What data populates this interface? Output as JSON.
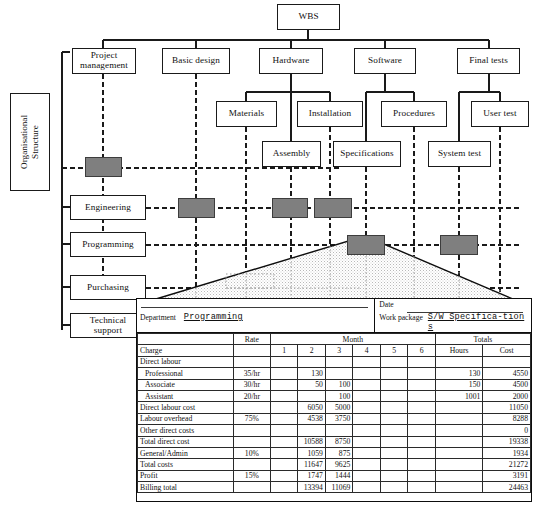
{
  "diagram": {
    "org_panel_label": "Organisational\nStructure",
    "wbs": {
      "root": {
        "label": "WBS"
      },
      "level1": [
        {
          "label": "Project\nmanagement"
        },
        {
          "label": "Basic design"
        },
        {
          "label": "Hardware"
        },
        {
          "label": "Software"
        },
        {
          "label": "Final tests"
        }
      ],
      "level2": [
        {
          "label": "Materials"
        },
        {
          "label": "Installation"
        },
        {
          "label": "Procedures"
        },
        {
          "label": "User test"
        }
      ],
      "level3": [
        {
          "label": "Assembly"
        },
        {
          "label": "Specifications"
        },
        {
          "label": "System test"
        }
      ]
    },
    "org_units": [
      {
        "label": "Engineering"
      },
      {
        "label": "Programming"
      },
      {
        "label": "Purchasing"
      },
      {
        "label": "Technical\nsupport"
      }
    ],
    "resource_curve": {
      "shape": "triangle",
      "fill": "stippled"
    }
  },
  "form": {
    "department_label": "Department",
    "department_value": "Programming",
    "date_label": "Date",
    "date_value": "",
    "work_package_label": "Work package",
    "work_package_value": "S/W Specifica-tions",
    "header": {
      "charge": "Charge",
      "rate": "Rate",
      "month": "Month",
      "months": [
        "1",
        "2",
        "3",
        "4",
        "5",
        "6"
      ],
      "totals": "Totals",
      "hours": "Hours",
      "cost": "Cost"
    },
    "rows": [
      {
        "label": "Direct labour",
        "indent": false,
        "rate": "",
        "months": [
          "",
          "",
          "",
          "",
          "",
          ""
        ],
        "hours": "",
        "cost": "",
        "rule": "top"
      },
      {
        "label": "Professional",
        "indent": true,
        "rate": "35/hr",
        "months": [
          "",
          "130",
          "",
          "",
          "",
          ""
        ],
        "hours": "130",
        "cost": "4550",
        "rule": ""
      },
      {
        "label": "Associate",
        "indent": true,
        "rate": "30/hr",
        "months": [
          "",
          "50",
          "100",
          "",
          "",
          ""
        ],
        "hours": "150",
        "cost": "4500",
        "rule": ""
      },
      {
        "label": "Assistant",
        "indent": true,
        "rate": "20/hr",
        "months": [
          "",
          "",
          "100",
          "",
          "",
          ""
        ],
        "hours": "1001",
        "cost": "2000",
        "rule": ""
      },
      {
        "label": "Direct labour cost",
        "indent": false,
        "rate": "",
        "months": [
          "",
          "6050",
          "5000",
          "",
          "",
          ""
        ],
        "hours": "",
        "cost": "11050",
        "rule": "top"
      },
      {
        "label": "Labour overhead",
        "indent": false,
        "rate": "75%",
        "months": [
          "",
          "4538",
          "3750",
          "",
          "",
          ""
        ],
        "hours": "",
        "cost": "8288",
        "rule": ""
      },
      {
        "label": "Other direct costs",
        "indent": false,
        "rate": "",
        "months": [
          "",
          "",
          "",
          "",
          "",
          ""
        ],
        "hours": "",
        "cost": "0",
        "rule": ""
      },
      {
        "label": "Total direct cost",
        "indent": false,
        "rate": "",
        "months": [
          "",
          "10588",
          "8750",
          "",
          "",
          ""
        ],
        "hours": "",
        "cost": "19338",
        "rule": "top"
      },
      {
        "label": "General/Admin",
        "indent": false,
        "rate": "10%",
        "months": [
          "",
          "1059",
          "875",
          "",
          "",
          ""
        ],
        "hours": "",
        "cost": "1934",
        "rule": ""
      },
      {
        "label": "Total costs",
        "indent": false,
        "rate": "",
        "months": [
          "",
          "11647",
          "9625",
          "",
          "",
          ""
        ],
        "hours": "",
        "cost": "21272",
        "rule": "top"
      },
      {
        "label": "Profit",
        "indent": false,
        "rate": "15%",
        "months": [
          "",
          "1747",
          "1444",
          "",
          "",
          ""
        ],
        "hours": "",
        "cost": "3191",
        "rule": ""
      },
      {
        "label": "Billing total",
        "indent": false,
        "rate": "",
        "months": [
          "",
          "13394",
          "11069",
          "",
          "",
          ""
        ],
        "hours": "",
        "cost": "24463",
        "rule": "top"
      }
    ]
  },
  "colors": {
    "line": "#1a1a1a",
    "cell_fill": "#7f7f7f",
    "cell_stroke": "#3d3d3d",
    "paper": "#ffffff"
  }
}
